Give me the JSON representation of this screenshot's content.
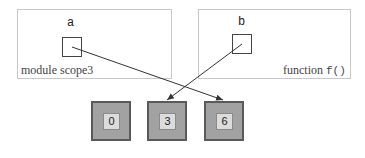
{
  "frames": [
    {
      "caption": "module scope3",
      "variable": "a"
    },
    {
      "caption_prefix": "function ",
      "caption_code": "f()",
      "variable": "b"
    }
  ],
  "objects": [
    {
      "value": "0"
    },
    {
      "value": "3"
    },
    {
      "value": "6"
    }
  ],
  "references": [
    {
      "from": "a",
      "to": "6"
    },
    {
      "from": "b",
      "to": "3"
    }
  ],
  "colors": {
    "frame_border": "#c8c8c8",
    "object_fill": "#a2a2a2",
    "object_border": "#5a5a5a",
    "inner_fill": "#dcdcdc",
    "arrow": "#333333"
  }
}
